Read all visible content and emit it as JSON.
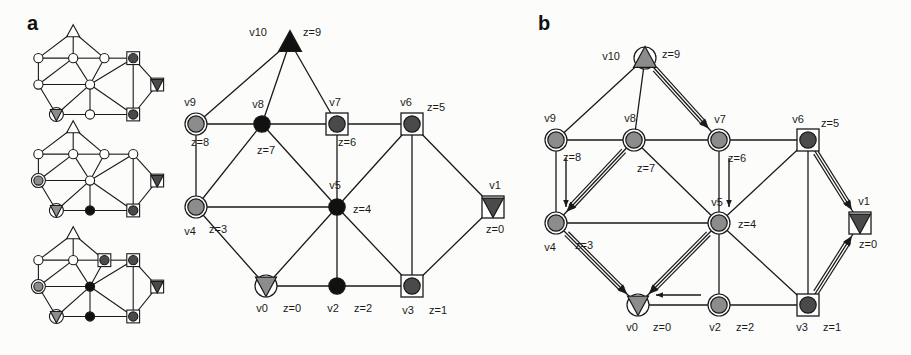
{
  "figure": {
    "width": 911,
    "height": 355,
    "background": "#fcfcfb"
  },
  "panels": [
    {
      "id": "a",
      "letter": "a",
      "x": 27,
      "y": 18
    },
    {
      "id": "b",
      "letter": "b",
      "x": 538,
      "y": 18
    }
  ],
  "colors": {
    "stroke": "#1a1a1a",
    "black_fill": "#111111",
    "dark_gray_fill": "#4a4a4a",
    "mid_gray_fill": "#8c8c8c",
    "light_gray_fill": "#b5b5b5",
    "white_fill": "#ffffff",
    "text": "#1a1a1a"
  },
  "thumbnails": [
    {
      "name": "thumbnail-step-1",
      "x": 30,
      "y": 30,
      "w": 120,
      "h": 88
    },
    {
      "name": "thumbnail-step-2",
      "x": 30,
      "y": 126,
      "w": 120,
      "h": 88
    },
    {
      "name": "thumbnail-step-3",
      "x": 30,
      "y": 232,
      "w": 120,
      "h": 88
    }
  ],
  "panel_a": {
    "label": "a",
    "caption": "",
    "nodes": [
      {
        "id": "v10",
        "label": "v10",
        "z_label": "z=9",
        "x": 290,
        "y": 42,
        "shape": "triangle-up",
        "fill": "#111111",
        "ring": false,
        "square": false,
        "label_dx": -32,
        "label_dy": -6,
        "z_dx": 22,
        "z_dy": -6
      },
      {
        "id": "v9",
        "label": "v9",
        "z_label": "z=8",
        "x": 196,
        "y": 124,
        "shape": "circle",
        "fill": "#8c8c8c",
        "ring": true,
        "square": false,
        "label_dx": -6,
        "label_dy": -18,
        "z_dx": 4,
        "z_dy": 22
      },
      {
        "id": "v8",
        "label": "v8",
        "z_label": "z=7",
        "x": 262,
        "y": 124,
        "shape": "circle",
        "fill": "#111111",
        "ring": false,
        "square": false,
        "label_dx": -4,
        "label_dy": -16,
        "z_dx": 4,
        "z_dy": 30
      },
      {
        "id": "v7",
        "label": "v7",
        "z_label": "z=6",
        "x": 337,
        "y": 124,
        "shape": "circle",
        "fill": "#4a4a4a",
        "ring": false,
        "square": true,
        "label_dx": -2,
        "label_dy": -18,
        "z_dx": 10,
        "z_dy": 22
      },
      {
        "id": "v6",
        "label": "v6",
        "z_label": "z=5",
        "x": 412,
        "y": 124,
        "shape": "circle",
        "fill": "#4a4a4a",
        "ring": false,
        "square": true,
        "label_dx": -6,
        "label_dy": -18,
        "z_dx": 24,
        "z_dy": -13
      },
      {
        "id": "v4",
        "label": "v4",
        "z_label": "z=3",
        "x": 196,
        "y": 207,
        "shape": "circle",
        "fill": "#8c8c8c",
        "ring": true,
        "square": false,
        "label_dx": -6,
        "label_dy": 28,
        "z_dx": 22,
        "z_dy": 26
      },
      {
        "id": "v5",
        "label": "v5",
        "z_label": "z=4",
        "x": 337,
        "y": 207,
        "shape": "circle",
        "fill": "#111111",
        "ring": false,
        "square": false,
        "label_dx": -2,
        "label_dy": -18,
        "z_dx": 25,
        "z_dy": 6
      },
      {
        "id": "v1",
        "label": "v1",
        "z_label": "z=0",
        "x": 493,
        "y": 207,
        "shape": "triangle-down",
        "fill": "#4a4a4a",
        "ring": false,
        "square": true,
        "label_dx": 2,
        "label_dy": -18,
        "z_dx": 2,
        "z_dy": 26
      },
      {
        "id": "v0",
        "label": "v0",
        "z_label": "z=0",
        "x": 266,
        "y": 286,
        "shape": "triangle-down",
        "fill": "#8c8c8c",
        "ring": true,
        "square": false,
        "label_dx": -4,
        "label_dy": 26,
        "z_dx": 26,
        "z_dy": 26
      },
      {
        "id": "v2",
        "label": "v2",
        "z_label": "z=2",
        "x": 337,
        "y": 286,
        "shape": "circle",
        "fill": "#111111",
        "ring": false,
        "square": false,
        "label_dx": -4,
        "label_dy": 26,
        "z_dx": 26,
        "z_dy": 26
      },
      {
        "id": "v3",
        "label": "v3",
        "z_label": "z=1",
        "x": 412,
        "y": 286,
        "shape": "circle",
        "fill": "#4a4a4a",
        "ring": false,
        "square": true,
        "label_dx": -4,
        "label_dy": 28,
        "z_dx": 26,
        "z_dy": 28
      }
    ],
    "edges": [
      [
        "v10",
        "v9"
      ],
      [
        "v10",
        "v8"
      ],
      [
        "v10",
        "v7"
      ],
      [
        "v9",
        "v8"
      ],
      [
        "v8",
        "v7"
      ],
      [
        "v7",
        "v6"
      ],
      [
        "v9",
        "v4"
      ],
      [
        "v8",
        "v4"
      ],
      [
        "v8",
        "v5"
      ],
      [
        "v4",
        "v5"
      ],
      [
        "v7",
        "v5"
      ],
      [
        "v6",
        "v5"
      ],
      [
        "v4",
        "v0"
      ],
      [
        "v0",
        "v5"
      ],
      [
        "v5",
        "v2"
      ],
      [
        "v5",
        "v3"
      ],
      [
        "v0",
        "v2"
      ],
      [
        "v2",
        "v3"
      ],
      [
        "v6",
        "v3"
      ],
      [
        "v6",
        "v1"
      ],
      [
        "v1",
        "v3"
      ]
    ]
  },
  "panel_b": {
    "label": "b",
    "nodes": [
      {
        "id": "v10",
        "label": "v10",
        "z_label": "z=9",
        "x": 645,
        "y": 58,
        "shape": "triangle-up",
        "fill": "#8c8c8c",
        "ring": true,
        "square": false,
        "label_dx": -34,
        "label_dy": 2,
        "z_dx": 26,
        "z_dy": 0
      },
      {
        "id": "v9",
        "label": "v9",
        "z_label": "z=8",
        "x": 556,
        "y": 140,
        "shape": "circle",
        "fill": "#8c8c8c",
        "ring": true,
        "square": false,
        "label_dx": -6,
        "label_dy": -18,
        "z_dx": 16,
        "z_dy": 21
      },
      {
        "id": "v8",
        "label": "v8",
        "z_label": "z=7",
        "x": 634,
        "y": 140,
        "shape": "circle",
        "fill": "#8c8c8c",
        "ring": true,
        "square": false,
        "label_dx": -4,
        "label_dy": -18,
        "z_dx": 12,
        "z_dy": 32
      },
      {
        "id": "v7",
        "label": "v7",
        "z_label": "z=6",
        "x": 719,
        "y": 140,
        "shape": "circle",
        "fill": "#8c8c8c",
        "ring": true,
        "square": false,
        "label_dx": 1,
        "label_dy": -17,
        "z_dx": 18,
        "z_dy": 22
      },
      {
        "id": "v6",
        "label": "v6",
        "z_label": "z=5",
        "x": 808,
        "y": 140,
        "shape": "circle",
        "fill": "#4a4a4a",
        "ring": false,
        "square": true,
        "label_dx": -10,
        "label_dy": -17,
        "z_dx": 22,
        "z_dy": -13
      },
      {
        "id": "v4",
        "label": "v4",
        "z_label": "z=3",
        "x": 556,
        "y": 223,
        "shape": "circle",
        "fill": "#8c8c8c",
        "ring": true,
        "square": false,
        "label_dx": -6,
        "label_dy": 28,
        "z_dx": 28,
        "z_dy": 26
      },
      {
        "id": "v5",
        "label": "v5",
        "z_label": "z=4",
        "x": 719,
        "y": 223,
        "shape": "circle",
        "fill": "#8c8c8c",
        "ring": true,
        "square": false,
        "label_dx": -2,
        "label_dy": -17,
        "z_dx": 28,
        "z_dy": 5
      },
      {
        "id": "v1",
        "label": "v1",
        "z_label": "z=0",
        "x": 860,
        "y": 223,
        "shape": "triangle-down",
        "fill": "#4a4a4a",
        "ring": false,
        "square": true,
        "label_dx": 4,
        "label_dy": -18,
        "z_dx": 8,
        "z_dy": 25
      },
      {
        "id": "v0",
        "label": "v0",
        "z_label": "z=0",
        "x": 638,
        "y": 305,
        "shape": "triangle-down",
        "fill": "#8c8c8c",
        "ring": true,
        "square": false,
        "label_dx": -6,
        "label_dy": 26,
        "z_dx": 24,
        "z_dy": 26
      },
      {
        "id": "v2",
        "label": "v2",
        "z_label": "z=2",
        "x": 719,
        "y": 305,
        "shape": "circle",
        "fill": "#8c8c8c",
        "ring": true,
        "square": false,
        "label_dx": -4,
        "label_dy": 26,
        "z_dx": 26,
        "z_dy": 26
      },
      {
        "id": "v3",
        "label": "v3",
        "z_label": "z=1",
        "x": 808,
        "y": 305,
        "shape": "circle",
        "fill": "#4a4a4a",
        "ring": false,
        "square": true,
        "label_dx": -6,
        "label_dy": 26,
        "z_dx": 24,
        "z_dy": 26
      }
    ],
    "edges": [
      [
        "v10",
        "v9"
      ],
      [
        "v10",
        "v8"
      ],
      [
        "v10",
        "v7"
      ],
      [
        "v9",
        "v8"
      ],
      [
        "v8",
        "v7"
      ],
      [
        "v7",
        "v6"
      ],
      [
        "v9",
        "v4"
      ],
      [
        "v8",
        "v4"
      ],
      [
        "v8",
        "v5"
      ],
      [
        "v4",
        "v5"
      ],
      [
        "v7",
        "v5"
      ],
      [
        "v6",
        "v5"
      ],
      [
        "v4",
        "v0"
      ],
      [
        "v0",
        "v5"
      ],
      [
        "v5",
        "v2"
      ],
      [
        "v5",
        "v3"
      ],
      [
        "v0",
        "v2"
      ],
      [
        "v2",
        "v3"
      ],
      [
        "v6",
        "v3"
      ],
      [
        "v6",
        "v1"
      ],
      [
        "v1",
        "v3"
      ]
    ],
    "arrows_double": [
      {
        "from": "v10",
        "to": "v7",
        "name": "arrow-v10-v7"
      },
      {
        "from": "v8",
        "to": "v4",
        "name": "arrow-v8-v4"
      },
      {
        "from": "v4",
        "to": "v0",
        "name": "arrow-v4-v0"
      },
      {
        "from": "v5",
        "to": "v0",
        "name": "arrow-v5-v0"
      },
      {
        "from": "v6",
        "to": "v1",
        "name": "arrow-v6-v1"
      },
      {
        "from": "v3",
        "to": "v1",
        "name": "arrow-v3-v1"
      }
    ],
    "arrows_single": [
      {
        "from": "v9",
        "to": "v4",
        "name": "arrow-v9-v4"
      },
      {
        "from": "v7",
        "to": "v5",
        "name": "arrow-v7-v5"
      },
      {
        "from": "v2",
        "to": "v0",
        "name": "arrow-v2-v0"
      }
    ]
  }
}
